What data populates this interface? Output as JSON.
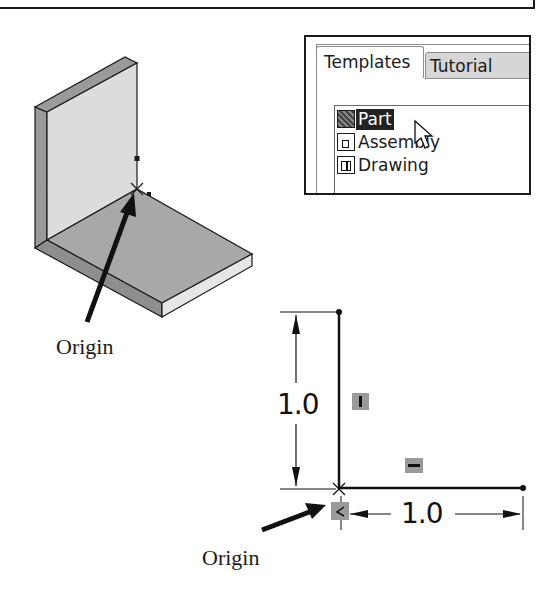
{
  "dialog": {
    "tabs": [
      {
        "label": "Templates",
        "active": true
      },
      {
        "label": "Tutorial",
        "active": false
      }
    ],
    "items": [
      {
        "label": "Part",
        "icon": "part-icon",
        "selected": true
      },
      {
        "label": "Assembly",
        "icon": "assembly-icon",
        "selected": false
      },
      {
        "label": "Drawing",
        "icon": "drawing-icon",
        "selected": false
      }
    ]
  },
  "model_view": {
    "origin_label": "Origin"
  },
  "sketch_view": {
    "vertical_dimension": "1.0",
    "horizontal_dimension": "1.0",
    "origin_label": "Origin",
    "relations": [
      "vertical-relation-icon",
      "horizontal-relation-icon",
      "coincident-relation-icon"
    ]
  },
  "colors": {
    "outline": "#1a1a1a",
    "plate_front": "#d9d9d9",
    "plate_edge": "#9a9a9a",
    "base_top": "#a8a8a8",
    "base_side_light": "#e6e6e6",
    "base_side_dark": "#8e8e8e",
    "relation_bg": "#9a9a9a"
  }
}
